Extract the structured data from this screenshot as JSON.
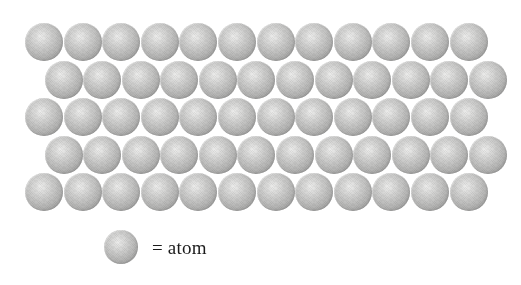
{
  "figure": {
    "kind": "atomic-packing-diagram",
    "background_color": "#ffffff",
    "width": 521,
    "height": 285
  },
  "lattice": {
    "rows_total": 5,
    "atoms_per_row": 12,
    "atoms_total": 60,
    "atom_diameter_px": 38,
    "packing": "hexagonal close-packed rows, alternating rows offset by half a diameter",
    "rows": [
      {
        "index": 1,
        "count": 12,
        "offset_left_px": 25,
        "top_px": 23,
        "offset_kind": "aligned"
      },
      {
        "index": 2,
        "count": 12,
        "offset_left_px": 44.5,
        "top_px": 61,
        "offset_kind": "staggered"
      },
      {
        "index": 3,
        "count": 12,
        "offset_left_px": 25,
        "top_px": 98,
        "offset_kind": "aligned"
      },
      {
        "index": 4,
        "count": 12,
        "offset_left_px": 44.5,
        "top_px": 136,
        "offset_kind": "staggered"
      },
      {
        "index": 5,
        "count": 12,
        "offset_left_px": 25,
        "top_px": 173,
        "offset_kind": "aligned"
      }
    ]
  },
  "legend": {
    "label": "= atom",
    "swatch_shape": "sphere",
    "swatch_diameter_px": 34
  },
  "colors": {
    "sphere_highlight": "#ececeb",
    "sphere_mid": "#c4c4c3",
    "sphere_rim": "#949493",
    "text": "#1b1b1b",
    "background": "#ffffff"
  }
}
